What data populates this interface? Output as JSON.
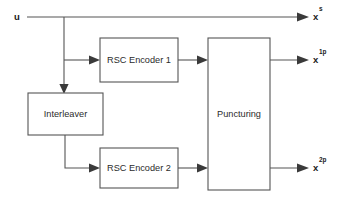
{
  "diagram": {
    "stroke_color": "#555555",
    "text_color": "#2b2b2b",
    "background": "#ffffff",
    "blocks": [
      {
        "id": "rsc1",
        "label": "RSC Encoder 1",
        "x": 100,
        "y": 38,
        "w": 78,
        "h": 44
      },
      {
        "id": "interleaver",
        "label": "Interleaver",
        "x": 28,
        "y": 93,
        "w": 75,
        "h": 42
      },
      {
        "id": "rsc2",
        "label": "RSC Encoder 2",
        "x": 100,
        "y": 148,
        "w": 78,
        "h": 40
      },
      {
        "id": "puncturing",
        "label": "Puncturing",
        "x": 208,
        "y": 38,
        "w": 62,
        "h": 152
      }
    ],
    "signals": [
      {
        "id": "input",
        "base": "u",
        "sup": "",
        "x": 17,
        "y": 17
      },
      {
        "id": "systematic-output",
        "base": "x",
        "sup": "s",
        "x": 313,
        "y": 17
      },
      {
        "id": "parity1-output",
        "base": "x",
        "sup": "1p",
        "x": 313,
        "y": 60
      },
      {
        "id": "parity2-output",
        "base": "x",
        "sup": "2p",
        "x": 313,
        "y": 168
      }
    ],
    "wires": [
      {
        "id": "input-main-line",
        "from": "u",
        "to": "x-s",
        "y": 17
      },
      {
        "id": "branch-down",
        "from": "main-line",
        "to": "interleaver",
        "x": 64
      },
      {
        "id": "branch-to-rsc1",
        "from": "branch-down",
        "to": "rsc1",
        "y": 60
      },
      {
        "id": "interleaver-to-rsc2",
        "from": "interleaver",
        "to": "rsc2",
        "y": 168
      },
      {
        "id": "rsc1-to-puncturing",
        "from": "rsc1",
        "to": "puncturing",
        "y": 60
      },
      {
        "id": "rsc2-to-puncturing",
        "from": "rsc2",
        "to": "puncturing",
        "y": 168
      },
      {
        "id": "puncturing-to-x1p",
        "from": "puncturing",
        "to": "x-1p",
        "y": 60
      },
      {
        "id": "puncturing-to-x2p",
        "from": "puncturing",
        "to": "x-2p",
        "y": 168
      }
    ]
  }
}
